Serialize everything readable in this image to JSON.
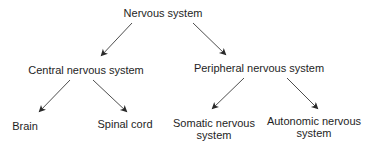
{
  "diagram": {
    "type": "hierarchy-tree",
    "colors": {
      "text": "#1e1e1e",
      "arrow": "#3a3a3a",
      "background": "#ffffff"
    },
    "nodes": {
      "root": {
        "label": "Nervous system",
        "x": 163,
        "y": 13
      },
      "cns": {
        "label": "Central nervous system",
        "x": 86,
        "y": 70
      },
      "pns": {
        "label": "Peripheral nervous system",
        "x": 259,
        "y": 68
      },
      "brain": {
        "label": "Brain",
        "x": 25,
        "y": 126
      },
      "spinal_cord": {
        "label": "Spinal cord",
        "x": 125,
        "y": 124
      },
      "somatic": {
        "line1": "Somatic nervous",
        "line2": "system",
        "x": 214,
        "y": 129
      },
      "autonomic": {
        "line1": "Autonomic nervous",
        "line2": "system",
        "x": 314,
        "y": 127
      }
    },
    "edges": [
      {
        "from": "root",
        "to": "cns",
        "x1": 132,
        "y1": 23,
        "x2": 101,
        "y2": 56
      },
      {
        "from": "root",
        "to": "pns",
        "x1": 193,
        "y1": 23,
        "x2": 226,
        "y2": 55
      },
      {
        "from": "cns",
        "to": "brain",
        "x1": 70,
        "y1": 80,
        "x2": 39,
        "y2": 112
      },
      {
        "from": "cns",
        "to": "spinal_cord",
        "x1": 93,
        "y1": 80,
        "x2": 127,
        "y2": 112
      },
      {
        "from": "pns",
        "to": "somatic",
        "x1": 244,
        "y1": 78,
        "x2": 212,
        "y2": 109
      },
      {
        "from": "pns",
        "to": "autonomic",
        "x1": 287,
        "y1": 78,
        "x2": 318,
        "y2": 109
      }
    ]
  }
}
